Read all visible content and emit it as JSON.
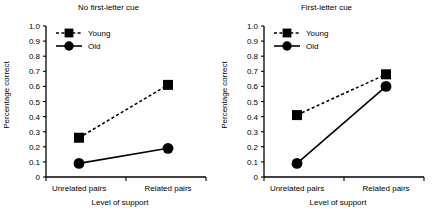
{
  "chart_data": {
    "type": "line",
    "title": "",
    "panels": [
      {
        "title": "No first-letter cue",
        "xlabel": "Level of support",
        "ylabel": "Percentage correct",
        "categories": [
          "Unrelated pairs",
          "Related pairs"
        ],
        "ylim": [
          0,
          1.0
        ],
        "ytick_labels": [
          "0",
          "0.1",
          "0.2",
          "0.3",
          "0.4",
          "0.5",
          "0.6",
          "0.7",
          "0.8",
          "0.9",
          "1.0"
        ],
        "ytick_values": [
          0,
          0.1,
          0.2,
          0.3,
          0.4,
          0.5,
          0.6,
          0.7,
          0.8,
          0.9,
          1.0
        ],
        "grid": false,
        "legend_position": "top-left",
        "series": [
          {
            "name": "Young",
            "values": [
              0.26,
              0.61
            ],
            "marker": "square",
            "line": "dashed"
          },
          {
            "name": "Old",
            "values": [
              0.09,
              0.19
            ],
            "marker": "circle",
            "line": "solid"
          }
        ]
      },
      {
        "title": "First-letter cue",
        "xlabel": "Level of support",
        "ylabel": "Percentage correct",
        "categories": [
          "Unrelated pairs",
          "Related pairs"
        ],
        "ylim": [
          0,
          1.0
        ],
        "ytick_labels": [
          "0",
          "0.1",
          "0.2",
          "0.3",
          "0.4",
          "0.5",
          "0.6",
          "0.7",
          "0.8",
          "0.9",
          "1.0"
        ],
        "ytick_values": [
          0,
          0.1,
          0.2,
          0.3,
          0.4,
          0.5,
          0.6,
          0.7,
          0.8,
          0.9,
          1.0
        ],
        "grid": false,
        "legend_position": "top-left",
        "series": [
          {
            "name": "Young",
            "values": [
              0.41,
              0.68
            ],
            "marker": "square",
            "line": "dashed"
          },
          {
            "name": "Old",
            "values": [
              0.09,
              0.6
            ],
            "marker": "circle",
            "line": "solid"
          }
        ]
      }
    ],
    "colors": {
      "series": "#000000",
      "axis": "#000000",
      "background": "#ffffff"
    }
  }
}
